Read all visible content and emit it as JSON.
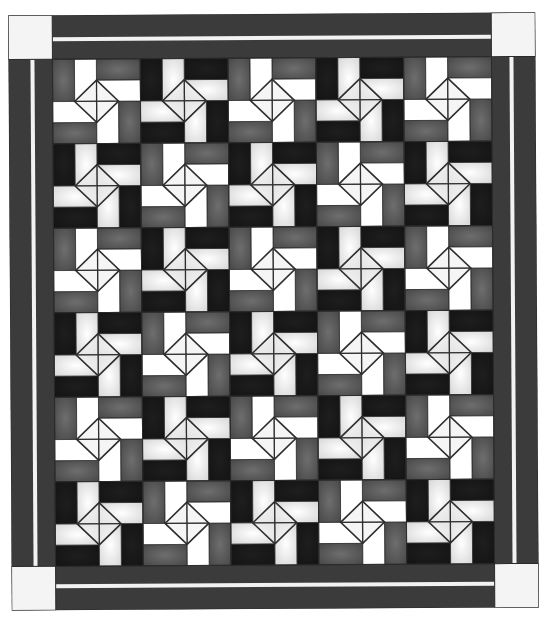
{
  "title": "Pinwheel quilt layout",
  "quilt": {
    "columns": 5,
    "rows": 6,
    "border": {
      "fabric": "dark-gray",
      "color": "#3b3b3b",
      "stripe_color": "#f2f2f2",
      "corner_square_color": "#f4f4f4",
      "outline_color": "#2a2a2a"
    },
    "block_types": {
      "A": {
        "name": "gray-white pinwheel",
        "outer": "#4a4a4a",
        "outer_center": "#6e6e6e",
        "inner": "#ffffff",
        "inner_center": "#ffffff"
      },
      "B": {
        "name": "black-light pinwheel",
        "outer": "#141414",
        "outer_center": "#1e1e1e",
        "inner": "#d9d9d9",
        "inner_center": "#ffffff"
      }
    },
    "center_diamond": {
      "fill": "#ececec",
      "line_color": "#2e2e2e"
    },
    "layout": [
      [
        "A",
        "B",
        "A",
        "B",
        "A"
      ],
      [
        "B",
        "A",
        "B",
        "A",
        "B"
      ],
      [
        "A",
        "B",
        "A",
        "B",
        "A"
      ],
      [
        "B",
        "A",
        "B",
        "A",
        "B"
      ],
      [
        "A",
        "B",
        "A",
        "B",
        "A"
      ],
      [
        "B",
        "A",
        "B",
        "A",
        "B"
      ]
    ]
  }
}
